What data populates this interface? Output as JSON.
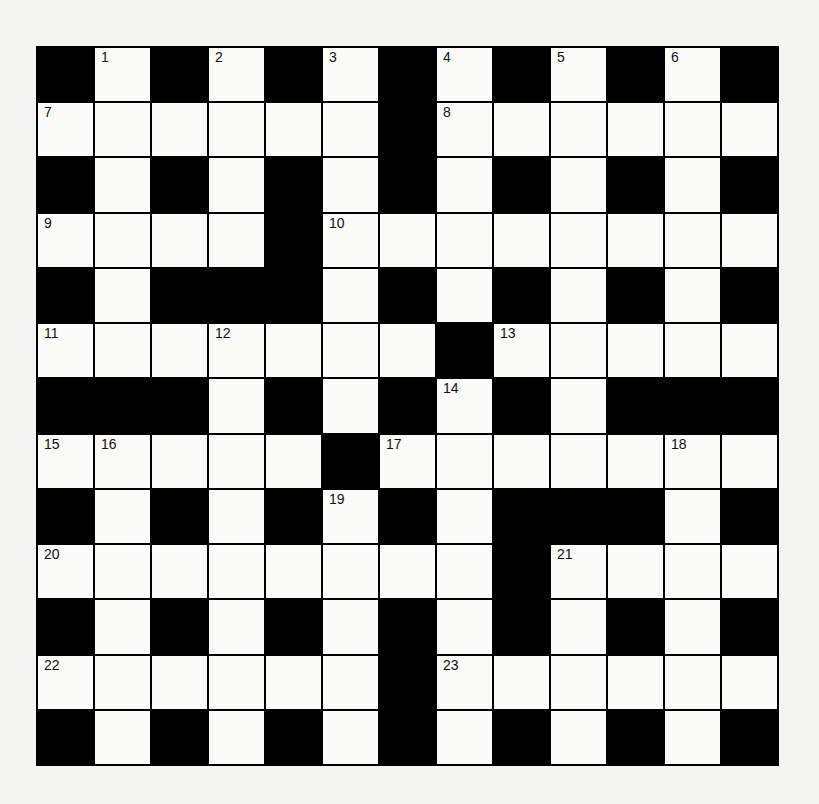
{
  "puzzle": {
    "rows": 13,
    "cols": 13,
    "grid": [
      "#.#.#.#.#.#.#",
      "......#......",
      "#.#.#.#.#.#.#",
      "....#........",
      "#.###.#.#.#.#",
      ".......#.....",
      "###.#.#.#.###",
      ".....#.......",
      "#.#.#.#.###.#",
      "........#....",
      "#.#.#.#.#.#.#",
      "......#......",
      "#.#.#.#.#.#.#"
    ],
    "numbers": [
      {
        "r": 0,
        "c": 1,
        "n": "1"
      },
      {
        "r": 0,
        "c": 3,
        "n": "2"
      },
      {
        "r": 0,
        "c": 5,
        "n": "3"
      },
      {
        "r": 0,
        "c": 7,
        "n": "4"
      },
      {
        "r": 0,
        "c": 9,
        "n": "5"
      },
      {
        "r": 0,
        "c": 11,
        "n": "6"
      },
      {
        "r": 1,
        "c": 0,
        "n": "7"
      },
      {
        "r": 1,
        "c": 7,
        "n": "8"
      },
      {
        "r": 3,
        "c": 0,
        "n": "9"
      },
      {
        "r": 3,
        "c": 5,
        "n": "10"
      },
      {
        "r": 5,
        "c": 0,
        "n": "11"
      },
      {
        "r": 5,
        "c": 3,
        "n": "12"
      },
      {
        "r": 5,
        "c": 8,
        "n": "13"
      },
      {
        "r": 6,
        "c": 7,
        "n": "14"
      },
      {
        "r": 7,
        "c": 0,
        "n": "15"
      },
      {
        "r": 7,
        "c": 1,
        "n": "16"
      },
      {
        "r": 7,
        "c": 6,
        "n": "17"
      },
      {
        "r": 7,
        "c": 11,
        "n": "18"
      },
      {
        "r": 8,
        "c": 5,
        "n": "19"
      },
      {
        "r": 9,
        "c": 0,
        "n": "20"
      },
      {
        "r": 9,
        "c": 9,
        "n": "21"
      },
      {
        "r": 11,
        "c": 0,
        "n": "22"
      },
      {
        "r": 11,
        "c": 7,
        "n": "23"
      }
    ]
  }
}
